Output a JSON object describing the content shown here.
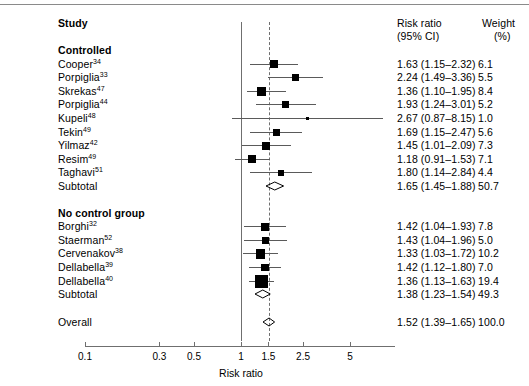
{
  "header": {
    "study_label": "Study",
    "rr_label_line1": "Risk ratio",
    "rr_label_line2": "(95% CI)",
    "weight_label_line1": "Weight",
    "weight_label_line2": "(%)"
  },
  "groups": [
    {
      "heading": "Controlled",
      "subtotal_label": "Subtotal",
      "subtotal_rr": "1.65 (1.45–1.88)",
      "subtotal_weight": "50.7",
      "subtotal_value": 1.65,
      "subtotal_low": 1.45,
      "subtotal_high": 1.88,
      "rows": [
        {
          "name": "Cooper",
          "ref": "34",
          "rr": "1.63 (1.15–2.32)",
          "weight": "6.1",
          "value": 1.63,
          "low": 1.15,
          "high": 2.32
        },
        {
          "name": "Porpiglia",
          "ref": "33",
          "rr": "2.24 (1.49–3.36)",
          "weight": "5.5",
          "value": 2.24,
          "low": 1.49,
          "high": 3.36
        },
        {
          "name": "Skrekas",
          "ref": "47",
          "rr": "1.36 (1.10–1.95)",
          "weight": "8.4",
          "value": 1.36,
          "low": 1.1,
          "high": 1.95
        },
        {
          "name": "Porpiglia",
          "ref": "44",
          "rr": "1.93 (1.24–3.01)",
          "weight": "5.2",
          "value": 1.93,
          "low": 1.24,
          "high": 3.01
        },
        {
          "name": "Kupeli",
          "ref": "48",
          "rr": "2.67 (0.87–8.15)",
          "weight": "1.0",
          "value": 2.67,
          "low": 0.87,
          "high": 8.15
        },
        {
          "name": "Tekin",
          "ref": "49",
          "rr": "1.69 (1.15–2.47)",
          "weight": "5.6",
          "value": 1.69,
          "low": 1.15,
          "high": 2.47
        },
        {
          "name": "Yilmaz",
          "ref": "42",
          "rr": "1.45 (1.01–2.09)",
          "weight": "7.3",
          "value": 1.45,
          "low": 1.01,
          "high": 2.09
        },
        {
          "name": "Resim",
          "ref": "49",
          "rr": "1.18 (0.91–1.53)",
          "weight": "7.1",
          "value": 1.18,
          "low": 0.91,
          "high": 1.53
        },
        {
          "name": "Taghavi",
          "ref": "51",
          "rr": "1.80 (1.14–2.84)",
          "weight": "4.4",
          "value": 1.8,
          "low": 1.14,
          "high": 2.84
        }
      ]
    },
    {
      "heading": "No control group",
      "subtotal_label": "Subtotal",
      "subtotal_rr": "1.38 (1.23–1.54)",
      "subtotal_weight": "49.3",
      "subtotal_value": 1.38,
      "subtotal_low": 1.23,
      "subtotal_high": 1.54,
      "rows": [
        {
          "name": "Borghi",
          "ref": "32",
          "rr": "1.42 (1.04–1.93)",
          "weight": "7.8",
          "value": 1.42,
          "low": 1.04,
          "high": 1.93
        },
        {
          "name": "Staerman",
          "ref": "52",
          "rr": "1.43 (1.04–1.96)",
          "weight": "5.0",
          "value": 1.43,
          "low": 1.04,
          "high": 1.96
        },
        {
          "name": "Cervenakov",
          "ref": "38",
          "rr": "1.33 (1.03–1.72)",
          "weight": "10.2",
          "value": 1.33,
          "low": 1.03,
          "high": 1.72
        },
        {
          "name": "Dellabella",
          "ref": "39",
          "rr": "1.42 (1.12–1.80)",
          "weight": "7.0",
          "value": 1.42,
          "low": 1.12,
          "high": 1.8
        },
        {
          "name": "Dellabella",
          "ref": "40",
          "rr": "1.36 (1.13–1.63)",
          "weight": "19.4",
          "value": 1.36,
          "low": 1.13,
          "high": 1.63
        }
      ]
    }
  ],
  "overall": {
    "label": "Overall",
    "rr": "1.52 (1.39–1.65)",
    "weight": "100.0",
    "value": 1.52,
    "low": 1.39,
    "high": 1.65
  },
  "axis": {
    "title": "Risk ratio",
    "ticks": [
      "0.1",
      "0.3",
      "0.5",
      "1",
      "1.5",
      "2.5",
      "5"
    ],
    "tick_values": [
      0.1,
      0.3,
      0.5,
      1,
      1.5,
      2.5,
      5
    ],
    "null_line_value": 1,
    "pooled_line_value": 1.52,
    "scale": "log"
  },
  "chart_data": {
    "type": "forest",
    "title": "",
    "xlabel": "Risk ratio",
    "ylabel": "",
    "scale": "log",
    "xlim": [
      0.1,
      8.5
    ],
    "xticks": [
      0.1,
      0.3,
      0.5,
      1,
      1.5,
      2.5,
      5
    ],
    "reference_line": 1,
    "pooled_line": 1.52,
    "columns": [
      "Study",
      "Risk ratio (95% CI)",
      "Weight (%)"
    ],
    "entries": [
      {
        "group": "Controlled",
        "study": "Cooper34",
        "rr": 1.63,
        "ci": [
          1.15,
          2.32
        ],
        "weight": 6.1
      },
      {
        "group": "Controlled",
        "study": "Porpiglia33",
        "rr": 2.24,
        "ci": [
          1.49,
          3.36
        ],
        "weight": 5.5
      },
      {
        "group": "Controlled",
        "study": "Skrekas47",
        "rr": 1.36,
        "ci": [
          1.1,
          1.95
        ],
        "weight": 8.4
      },
      {
        "group": "Controlled",
        "study": "Porpiglia44",
        "rr": 1.93,
        "ci": [
          1.24,
          3.01
        ],
        "weight": 5.2
      },
      {
        "group": "Controlled",
        "study": "Kupeli48",
        "rr": 2.67,
        "ci": [
          0.87,
          8.15
        ],
        "weight": 1.0
      },
      {
        "group": "Controlled",
        "study": "Tekin49",
        "rr": 1.69,
        "ci": [
          1.15,
          2.47
        ],
        "weight": 5.6
      },
      {
        "group": "Controlled",
        "study": "Yilmaz42",
        "rr": 1.45,
        "ci": [
          1.01,
          2.09
        ],
        "weight": 7.3
      },
      {
        "group": "Controlled",
        "study": "Resim49",
        "rr": 1.18,
        "ci": [
          0.91,
          1.53
        ],
        "weight": 7.1
      },
      {
        "group": "Controlled",
        "study": "Taghavi51",
        "rr": 1.8,
        "ci": [
          1.14,
          2.84
        ],
        "weight": 4.4
      },
      {
        "group": "Controlled",
        "study": "Subtotal",
        "rr": 1.65,
        "ci": [
          1.45,
          1.88
        ],
        "weight": 50.7,
        "summary": true
      },
      {
        "group": "No control group",
        "study": "Borghi32",
        "rr": 1.42,
        "ci": [
          1.04,
          1.93
        ],
        "weight": 7.8
      },
      {
        "group": "No control group",
        "study": "Staerman52",
        "rr": 1.43,
        "ci": [
          1.04,
          1.96
        ],
        "weight": 5.0
      },
      {
        "group": "No control group",
        "study": "Cervenakov38",
        "rr": 1.33,
        "ci": [
          1.03,
          1.72
        ],
        "weight": 10.2
      },
      {
        "group": "No control group",
        "study": "Dellabella39",
        "rr": 1.42,
        "ci": [
          1.12,
          1.8
        ],
        "weight": 7.0
      },
      {
        "group": "No control group",
        "study": "Dellabella40",
        "rr": 1.36,
        "ci": [
          1.13,
          1.63
        ],
        "weight": 19.4
      },
      {
        "group": "No control group",
        "study": "Subtotal",
        "rr": 1.38,
        "ci": [
          1.23,
          1.54
        ],
        "weight": 49.3,
        "summary": true
      },
      {
        "group": "Overall",
        "study": "Overall",
        "rr": 1.52,
        "ci": [
          1.39,
          1.65
        ],
        "weight": 100.0,
        "summary": true
      }
    ]
  }
}
